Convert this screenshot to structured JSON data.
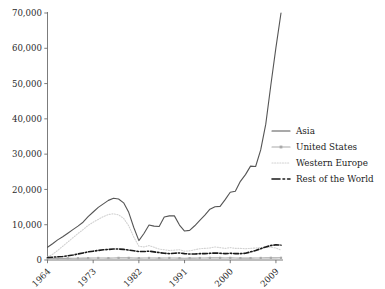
{
  "chart_data": {
    "type": "line",
    "title": "",
    "xlabel": "",
    "ylabel": "",
    "xlim": [
      1964,
      2010
    ],
    "ylim": [
      0,
      70000
    ],
    "grid": false,
    "legend_position": "right-middle",
    "y_ticks": [
      "0",
      "10,000",
      "20,000",
      "30,000",
      "40,000",
      "50,000",
      "60,000",
      "70,000"
    ],
    "y_tick_values": [
      0,
      10000,
      20000,
      30000,
      40000,
      50000,
      60000,
      70000
    ],
    "x_ticks": [
      "1964",
      "1973",
      "1982",
      "1991",
      "2000",
      "2009"
    ],
    "x_tick_values": [
      1964,
      1973,
      1982,
      1991,
      2000,
      2009
    ],
    "x": [
      1964,
      1965,
      1966,
      1967,
      1968,
      1969,
      1970,
      1971,
      1972,
      1973,
      1974,
      1975,
      1976,
      1977,
      1978,
      1979,
      1980,
      1981,
      1982,
      1983,
      1984,
      1985,
      1986,
      1987,
      1988,
      1989,
      1990,
      1991,
      1992,
      1993,
      1994,
      1995,
      1996,
      1997,
      1998,
      1999,
      2000,
      2001,
      2002,
      2003,
      2004,
      2005,
      2006,
      2007,
      2008,
      2009,
      2010
    ],
    "series": [
      {
        "name": "Asia",
        "color": "#555555",
        "style": "solid",
        "marker": "none",
        "values": [
          3600,
          4600,
          5700,
          6600,
          7600,
          8600,
          9600,
          10700,
          12300,
          13600,
          14900,
          15900,
          16900,
          17500,
          17300,
          16200,
          13500,
          9200,
          5500,
          7500,
          9900,
          9600,
          9500,
          12200,
          12500,
          12500,
          9900,
          8200,
          8400,
          9700,
          11200,
          12700,
          14400,
          15100,
          15200,
          17100,
          19200,
          19500,
          22300,
          24200,
          26600,
          26500,
          31200,
          38500,
          49600,
          60200,
          70000
        ]
      },
      {
        "name": "United States",
        "color": "#a9a9a9",
        "style": "solid-marker",
        "marker": "square",
        "values": [
          420,
          430,
          440,
          450,
          470,
          480,
          500,
          520,
          540,
          560,
          580,
          560,
          540,
          560,
          600,
          620,
          600,
          560,
          540,
          560,
          580,
          560,
          540,
          560,
          580,
          560,
          520,
          500,
          520,
          540,
          560,
          580,
          600,
          620,
          600,
          580,
          600,
          560,
          540,
          520,
          540,
          560,
          580,
          600,
          620,
          600,
          620
        ]
      },
      {
        "name": "Western Europe",
        "color": "#d2d2d2",
        "style": "dotted",
        "marker": "none",
        "values": [
          900,
          1600,
          2700,
          3900,
          5100,
          6300,
          7500,
          8600,
          9800,
          10700,
          11500,
          12300,
          12900,
          13100,
          12800,
          11800,
          9700,
          6500,
          3900,
          3700,
          4100,
          3600,
          3100,
          2900,
          2700,
          2800,
          2900,
          2500,
          2600,
          2900,
          3200,
          3300,
          3400,
          3700,
          3500,
          3300,
          3500,
          3300,
          3300,
          3200,
          3300,
          3400,
          3500,
          3600,
          3600,
          3400,
          2800
        ]
      },
      {
        "name": "Rest of the World",
        "color": "#1a1a1a",
        "style": "dashdot",
        "marker": "none",
        "values": [
          700,
          800,
          900,
          1000,
          1200,
          1400,
          1700,
          2000,
          2300,
          2500,
          2700,
          2900,
          3000,
          3100,
          3100,
          3000,
          2800,
          2600,
          2400,
          2400,
          2500,
          2300,
          2100,
          1900,
          1800,
          1900,
          2000,
          1800,
          1700,
          1700,
          1800,
          1800,
          1900,
          2000,
          1900,
          1800,
          1900,
          1800,
          1800,
          1900,
          2300,
          2700,
          3200,
          3700,
          4100,
          4300,
          4200
        ]
      }
    ]
  },
  "legend": {
    "items": [
      {
        "label": "Asia"
      },
      {
        "label": "United States"
      },
      {
        "label": "Western Europe"
      },
      {
        "label": "Rest of the World"
      }
    ]
  }
}
